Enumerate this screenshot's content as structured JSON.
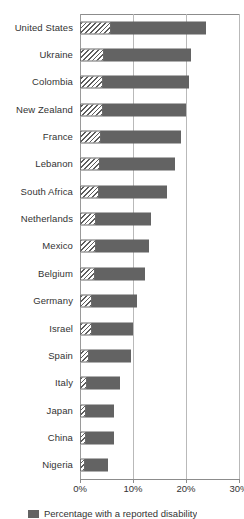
{
  "chart_data": {
    "type": "bar",
    "orientation": "horizontal",
    "stacked": true,
    "title": "",
    "xlabel": "",
    "ylabel": "",
    "xlim": [
      0,
      30
    ],
    "xticks": [
      "0%",
      "10%",
      "20%",
      "30%"
    ],
    "xtick_values": [
      0,
      10,
      20,
      30
    ],
    "grid": true,
    "legend_position": "bottom-left",
    "categories": [
      "United States",
      "Ukraine",
      "Colombia",
      "New Zealand",
      "France",
      "Lebanon",
      "South Africa",
      "Netherlands",
      "Mexico",
      "Belgium",
      "Germany",
      "Israel",
      "Spain",
      "Italy",
      "Japan",
      "China",
      "Nigeria"
    ],
    "series": [
      {
        "name": "Percentage with a reported disability",
        "style": "hatched",
        "color": "#ffffff",
        "values": [
          5.8,
          4.5,
          4.3,
          4.3,
          3.9,
          3.8,
          3.6,
          3.0,
          3.0,
          2.8,
          2.3,
          2.3,
          1.7,
          1.3,
          1.1,
          1.1,
          1.0
        ]
      },
      {
        "name": "Percentage without a reported disability",
        "style": "solid",
        "color": "#636363",
        "values": [
          18.0,
          16.5,
          16.2,
          15.7,
          15.1,
          14.2,
          12.8,
          10.4,
          10.0,
          9.4,
          8.5,
          7.7,
          8.0,
          6.3,
          5.3,
          5.3,
          4.3
        ]
      }
    ],
    "totals": [
      23.8,
      21.0,
      20.5,
      20.0,
      19.0,
      18.0,
      16.4,
      13.4,
      13.0,
      12.2,
      10.8,
      10.0,
      9.7,
      7.6,
      6.4,
      6.4,
      5.3
    ]
  },
  "legend": {
    "items": [
      {
        "label": "Percentage with a reported disability",
        "style": "hatched"
      }
    ]
  },
  "axis": {
    "ticks": [
      "0%",
      "10%",
      "20%",
      "30%"
    ]
  }
}
